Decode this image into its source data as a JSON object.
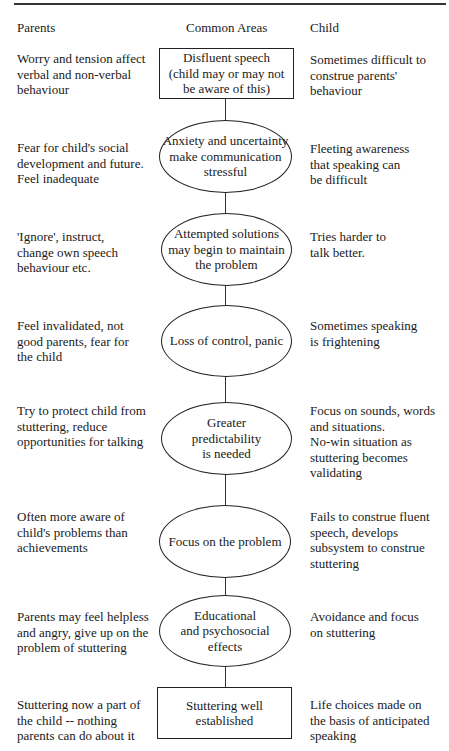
{
  "headers": {
    "parents": "Parents",
    "common": "Common Areas",
    "child": "Child"
  },
  "rows": [
    {
      "parents": "Worry and tension affect\nverbal and non-verbal\nbehaviour",
      "common": "Disfluent speech\n(child may or may not\nbe aware of this)",
      "shape": "box",
      "child": "Sometimes difficult to\nconstrue parents'\nbehaviour"
    },
    {
      "parents": "Fear for child's social\ndevelopment and future.\nFeel inadequate",
      "common": "Anxiety and uncertainty\nmake communication\nstressful",
      "shape": "ellipse",
      "child": "Fleeting awareness\nthat speaking can\nbe difficult"
    },
    {
      "parents": "'Ignore', instruct,\nchange own speech\nbehaviour etc.",
      "common": "Attempted solutions\nmay begin to maintain\nthe problem",
      "shape": "ellipse",
      "child": "Tries harder to\ntalk better."
    },
    {
      "parents": "Feel invalidated, not\ngood parents, fear for\nthe child",
      "common": "Loss of control, panic",
      "shape": "ellipse",
      "child": "Sometimes speaking\nis frightening"
    },
    {
      "parents": "Try to protect child from\nstuttering, reduce\nopportunities for talking",
      "common": "Greater\npredictability\nis needed",
      "shape": "ellipse",
      "child": "Focus on sounds, words\nand situations.\nNo-win situation as\nstuttering becomes\nvalidating"
    },
    {
      "parents": "Often more aware of\nchild's problems than\nachievements",
      "common": "Focus on the problem",
      "shape": "ellipse",
      "child": "Fails to construe fluent\nspeech, develops\nsubsystem to construe\nstuttering"
    },
    {
      "parents": "Parents may feel helpless\nand angry, give up on the\nproblem of stuttering",
      "common": "Educational\nand psychosocial\neffects",
      "shape": "ellipse",
      "child": "Avoidance and focus\non stuttering"
    },
    {
      "parents": "Stuttering now a part of\nthe child -- nothing\nparents can do about it",
      "common": "Stuttering well\nestablished",
      "shape": "box",
      "child": "Life choices made on\nthe basis of anticipated\nspeaking"
    }
  ]
}
